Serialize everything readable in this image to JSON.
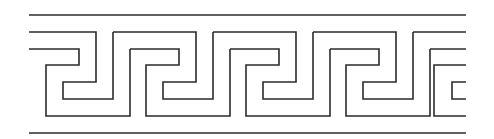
{
  "figure": {
    "stroke_color": "#2b2b2b",
    "background": "#ffffff",
    "stroke_width": 1.6,
    "border_top_y": 15,
    "border_bottom_y": 133,
    "x_start": 29,
    "x_end": 466,
    "period": 100,
    "unit_count": 4
  }
}
